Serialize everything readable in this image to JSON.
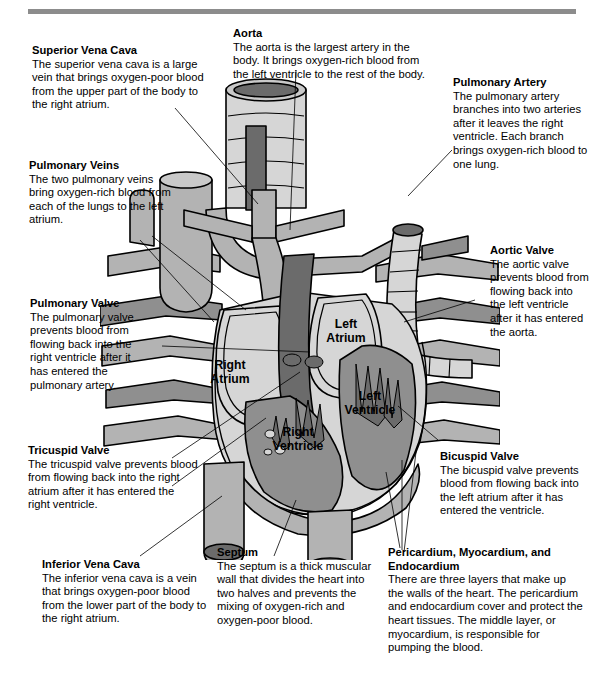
{
  "diagram": {
    "colors": {
      "rule": "#8c8c8c",
      "dark_gray": "#6b6b6b",
      "mid_gray": "#8f8f8f",
      "light_gray": "#b3b3b3",
      "pale_gray": "#d6d6d6",
      "outline": "#000000",
      "background": "#ffffff"
    }
  },
  "callouts": {
    "superior_vena_cava": {
      "title": "Superior Vena Cava",
      "body": "The superior vena cava is a large vein that brings oxygen-poor blood from the upper part of the body to the right atrium."
    },
    "aorta": {
      "title": "Aorta",
      "body": "The aorta is the largest artery in the body. It brings oxygen-rich blood from the left ventricle to the rest of the body."
    },
    "pulmonary_artery": {
      "title": "Pulmonary Artery",
      "body": "The pulmonary artery branches into two arteries after it leaves the right ventricle. Each branch brings oxygen-rich blood to one lung."
    },
    "pulmonary_veins": {
      "title": "Pulmonary Veins",
      "body": "The two pulmonary veins bring oxygen-rich blood from each of the lungs to the left atrium."
    },
    "aortic_valve": {
      "title": "Aortic Valve",
      "body": "The aortic valve prevents blood from flowing back into the left ventricle after it has entered the aorta."
    },
    "pulmonary_valve": {
      "title": "Pulmonary Valve",
      "body": "The pulmonary valve prevents blood from flowing back into the right ventricle after it has entered the pulmonary artery."
    },
    "tricuspid_valve": {
      "title": "Tricuspid Valve",
      "body": "The tricuspid valve prevents blood from flowing back into the right atrium after it has entered the right ventricle."
    },
    "bicuspid_valve": {
      "title": "Bicuspid Valve",
      "body": "The bicuspid valve prevents blood from flowing back into the left atrium after it has entered the ventricle."
    },
    "inferior_vena_cava": {
      "title": "Inferior Vena Cava",
      "body": "The inferior vena cava is a vein that brings oxygen-poor blood from the lower part of the body to the right atrium."
    },
    "septum": {
      "title": "Septum",
      "body": "The septum is a thick muscular wall that divides the heart into two halves and prevents the mixing of oxygen-rich and oxygen-poor blood."
    },
    "layers": {
      "title": "Pericardium, Myocardium, and Endocardium",
      "body": "There are three layers that make up the walls of the heart. The pericardium and endocardium cover and protect the heart tissues. The middle layer, or myocardium, is responsible for pumping the blood."
    }
  },
  "chambers": {
    "right_atrium": "Right\nAtrium",
    "left_atrium": "Left\nAtrium",
    "right_ventricle": "Right\nVentricle",
    "left_ventricle": "Left\nVentricle"
  }
}
